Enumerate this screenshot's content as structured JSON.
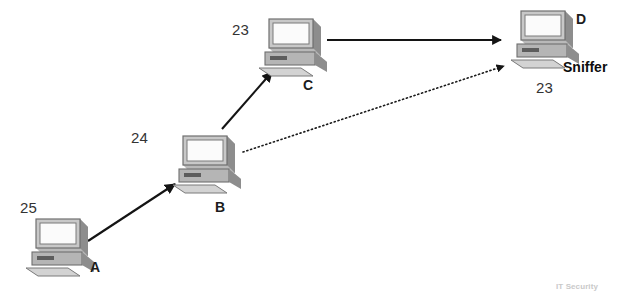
{
  "diagram": {
    "background_color": "#ffffff",
    "line_color": "#1a1a1a",
    "nodes": [
      {
        "id": "A",
        "name": "A",
        "port": "25",
        "role": "",
        "icon": "desktop-computer-icon",
        "x": 24,
        "y": 216,
        "port_x": 20,
        "port_y": 200,
        "name_x": 90,
        "name_y": 260,
        "role_x": 0,
        "role_y": 0
      },
      {
        "id": "B",
        "name": "B",
        "port": "24",
        "role": "",
        "icon": "desktop-computer-icon",
        "x": 171,
        "y": 133,
        "port_x": 131,
        "port_y": 130,
        "name_x": 215,
        "name_y": 200,
        "role_x": 0,
        "role_y": 0
      },
      {
        "id": "C",
        "name": "C",
        "port": "23",
        "role": "",
        "icon": "desktop-computer-icon",
        "x": 257,
        "y": 16,
        "port_x": 232,
        "port_y": 24,
        "name_x": 303,
        "name_y": 80,
        "role_x": 0,
        "role_y": 0
      },
      {
        "id": "D",
        "name": "D",
        "port": "23",
        "role": "Sniffer",
        "icon": "desktop-computer-icon",
        "x": 509,
        "y": 8,
        "port_x": 536,
        "port_y": 80,
        "name_x": 576,
        "name_y": 12,
        "role_x": 563,
        "role_y": 60
      }
    ],
    "edges": [
      {
        "id": "a-to-b",
        "from": "A",
        "to": "B",
        "style": "solid",
        "arrowhead": "filled-triangle",
        "x1": 88,
        "y1": 241,
        "x2": 175,
        "y2": 184
      },
      {
        "id": "b-to-c",
        "from": "B",
        "to": "C",
        "style": "solid",
        "arrowhead": "filled-triangle",
        "x1": 222,
        "y1": 129,
        "x2": 272,
        "y2": 72
      },
      {
        "id": "c-to-d",
        "from": "C",
        "to": "D",
        "style": "solid",
        "arrowhead": "filled-triangle",
        "x1": 327,
        "y1": 40,
        "x2": 503,
        "y2": 40
      },
      {
        "id": "b-to-d-sniffed",
        "from": "B",
        "to": "D",
        "style": "dotted",
        "arrowhead": "filled-triangle",
        "x1": 243,
        "y1": 152,
        "x2": 506,
        "y2": 66
      }
    ],
    "watermark": {
      "text": "IT Security",
      "x": 556,
      "y": 282
    }
  }
}
